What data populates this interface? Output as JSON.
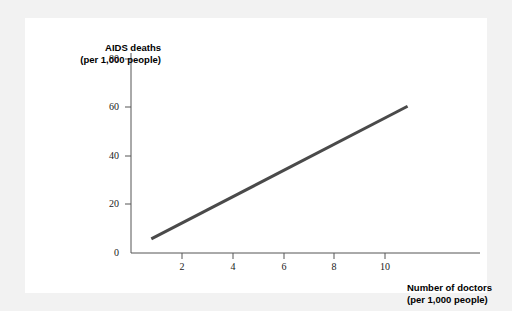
{
  "figure": {
    "background_color": "#f2f2f2",
    "card_color": "#ffffff"
  },
  "chart_data": {
    "type": "line",
    "title": "",
    "xlabel": "Number of doctors (per 1,000 people)",
    "ylabel": "AIDS deaths (per 1,000 people)",
    "xlabel_lines": [
      "Number of doctors",
      "(per 1,000 people)"
    ],
    "ylabel_lines": [
      "AIDS deaths",
      "(per 1,000 people)"
    ],
    "xlim": [
      0,
      11.6
    ],
    "ylim": [
      0,
      88
    ],
    "xticks": [
      2,
      4,
      6,
      8,
      10
    ],
    "yticks": [
      0,
      20,
      40,
      60,
      80
    ],
    "xtick_labels": [
      "2",
      "4",
      "6",
      "8",
      "10"
    ],
    "ytick_labels": [
      "0",
      "20",
      "40",
      "60",
      "80"
    ],
    "origin_label": "0",
    "grid": false,
    "legend": false,
    "series": [
      {
        "name": "AIDS deaths vs doctors",
        "color": "#4a4a4a",
        "line_width": 3,
        "x": [
          0.8,
          10.9
        ],
        "values": [
          5.8,
          60.5
        ]
      }
    ]
  }
}
